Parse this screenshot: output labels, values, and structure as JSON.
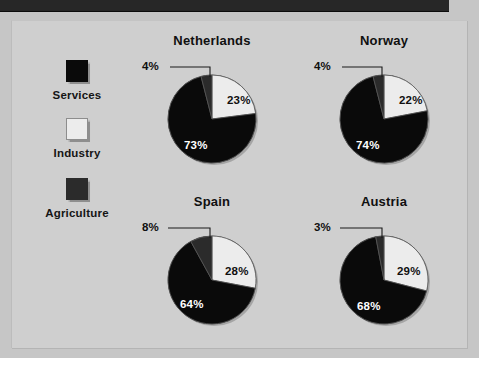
{
  "legend": {
    "items": [
      {
        "label": "Services",
        "color": "#0a0a0a",
        "swatch_name": "services"
      },
      {
        "label": "Industry",
        "color": "#ececec",
        "swatch_name": "industry"
      },
      {
        "label": "Agriculture",
        "color": "#2b2b2b",
        "swatch_name": "agriculture"
      }
    ]
  },
  "charts": [
    {
      "title": "Netherlands",
      "agriculture": "4%",
      "industry": "23%",
      "services": "73%"
    },
    {
      "title": "Norway",
      "agriculture": "4%",
      "industry": "22%",
      "services": "74%"
    },
    {
      "title": "Spain",
      "agriculture": "8%",
      "industry": "28%",
      "services": "64%"
    },
    {
      "title": "Austria",
      "agriculture": "3%",
      "industry": "29%",
      "services": "68%"
    }
  ],
  "chart_data": [
    {
      "type": "pie",
      "title": "Netherlands",
      "categories": [
        "Agriculture",
        "Industry",
        "Services"
      ],
      "values": [
        4,
        23,
        73
      ],
      "labels": [
        "4%",
        "23%",
        "73%"
      ],
      "colors": [
        "#2b2b2b",
        "#ececec",
        "#0a0a0a"
      ],
      "start_angle_deg": 0,
      "direction": "clockwise",
      "legend_position": "left",
      "grid": false
    },
    {
      "type": "pie",
      "title": "Norway",
      "categories": [
        "Agriculture",
        "Industry",
        "Services"
      ],
      "values": [
        4,
        22,
        74
      ],
      "labels": [
        "4%",
        "22%",
        "74%"
      ],
      "colors": [
        "#2b2b2b",
        "#ececec",
        "#0a0a0a"
      ],
      "start_angle_deg": 0,
      "direction": "clockwise",
      "legend_position": "left",
      "grid": false
    },
    {
      "type": "pie",
      "title": "Spain",
      "categories": [
        "Agriculture",
        "Industry",
        "Services"
      ],
      "values": [
        8,
        28,
        64
      ],
      "labels": [
        "8%",
        "28%",
        "64%"
      ],
      "colors": [
        "#2b2b2b",
        "#ececec",
        "#0a0a0a"
      ],
      "start_angle_deg": 0,
      "direction": "clockwise",
      "legend_position": "left",
      "grid": false
    },
    {
      "type": "pie",
      "title": "Austria",
      "categories": [
        "Agriculture",
        "Industry",
        "Services"
      ],
      "values": [
        3,
        29,
        68
      ],
      "labels": [
        "3%",
        "29%",
        "68%"
      ],
      "colors": [
        "#2b2b2b",
        "#ececec",
        "#0a0a0a"
      ],
      "start_angle_deg": 0,
      "direction": "clockwise",
      "legend_position": "left",
      "grid": false
    }
  ],
  "theme": {
    "page_bg": "#c6c6c6",
    "panel_bg": "#cfcfcf",
    "top_band": "#272727",
    "text": "#101010",
    "services_color": "#0a0a0a",
    "industry_color": "#ececec",
    "agriculture_color": "#2b2b2b"
  }
}
